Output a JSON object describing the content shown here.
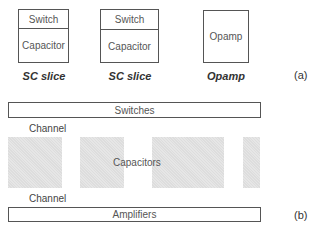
{
  "part_a": {
    "label": "(a)",
    "blocks": [
      {
        "top": "Switch",
        "bottom": "Capacitor",
        "caption": "SC slice"
      },
      {
        "top": "Switch",
        "bottom": "Capacitor",
        "caption": "SC slice"
      },
      {
        "body": "Opamp",
        "caption": "Opamp"
      }
    ]
  },
  "part_b": {
    "label": "(b)",
    "switches": "Switches",
    "channel_top": "Channel",
    "capacitors": "Capacitors",
    "channel_bottom": "Channel",
    "amplifiers": "Amplifiers",
    "capacitor_block_count": 4
  },
  "colors": {
    "border": "#555555",
    "capacitor_fill": "#e6e6e6"
  }
}
